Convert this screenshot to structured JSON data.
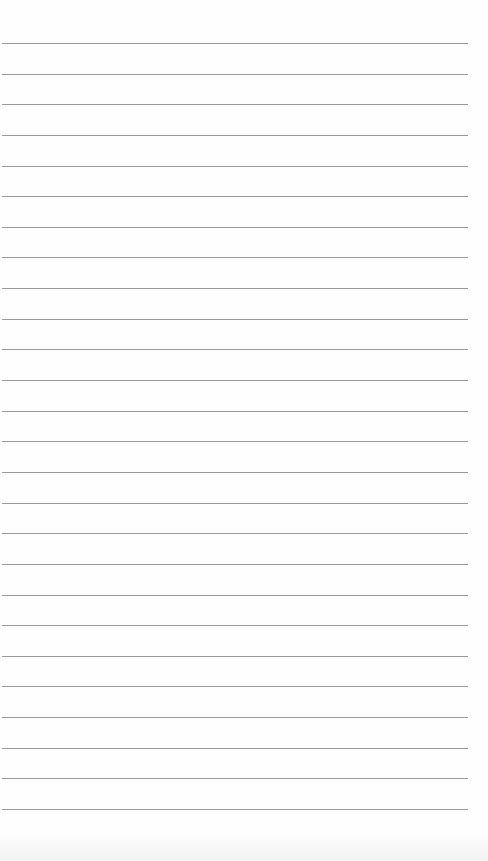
{
  "paper": {
    "type": "lined paper",
    "background_color": "#fefefe",
    "line_color": "#9a9a9a",
    "line_count": 26,
    "first_line_y": 43,
    "line_spacing": 30.64,
    "line_left_x": 2,
    "line_right_x": 468
  }
}
